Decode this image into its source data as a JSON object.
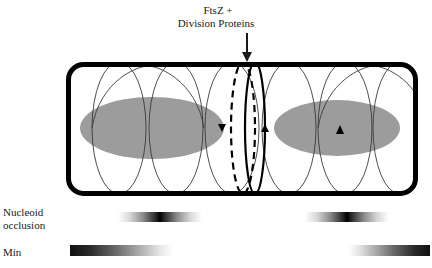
{
  "figure": {
    "title_label": {
      "line1": "FtsZ +",
      "line2": "Division Proteins"
    },
    "nucleoid_occlusion_label": {
      "line1": "Nucleoid",
      "line2": "occlusion"
    },
    "min_label": "Min",
    "colors": {
      "cell_wall": "#000000",
      "nucleoid_fill": "#9c9c9c",
      "helix_stroke": "#3a3a3a",
      "zring_stroke": "#000000",
      "background": "#ffffff",
      "text": "#1a1a1a"
    },
    "cell": {
      "x": 66,
      "y": 62,
      "width": 352,
      "height": 134,
      "corner_radius": 16,
      "wall_thickness": 5
    },
    "nucleoids": [
      {
        "name": "left-nucleoid",
        "cx": 152,
        "cy": 128,
        "rx": 72,
        "ry": 31
      },
      {
        "name": "right-nucleoid",
        "cx": 337,
        "cy": 128,
        "rx": 63,
        "ry": 28
      }
    ],
    "helix_rings": [
      {
        "cx": 119,
        "ry_ratio": 1.0
      },
      {
        "cx": 176,
        "ry_ratio": 1.0
      },
      {
        "cx": 232,
        "ry_ratio": 1.0
      },
      {
        "cx": 289,
        "ry_ratio": 1.0
      },
      {
        "cx": 345,
        "ry_ratio": 1.0
      },
      {
        "cx": 400,
        "ry_ratio": 1.0
      }
    ],
    "zring": {
      "dashed_cx": 243,
      "solid_cx": 253,
      "label": "Z-ring"
    },
    "arrow": {
      "x": 247,
      "y_start": 33,
      "y_end": 60
    },
    "arrowheads": [
      {
        "name": "left-ring-arrowhead",
        "x": 222,
        "y": 128,
        "direction": "down"
      },
      {
        "name": "right-ring-arrowhead",
        "x": 265,
        "y": 128,
        "direction": "up"
      },
      {
        "name": "nucleoid-ring-arrowhead",
        "x": 340,
        "y": 128,
        "direction": "up"
      }
    ],
    "gradient_bars": [
      {
        "name": "nucleoid-occlusion-left-bar",
        "x": 118,
        "y": 212,
        "width": 84,
        "height": 10,
        "type": "symmetric",
        "peak": "center"
      },
      {
        "name": "nucleoid-occlusion-right-bar",
        "x": 305,
        "y": 212,
        "width": 84,
        "height": 10,
        "type": "symmetric",
        "peak": "center"
      },
      {
        "name": "min-left-bar",
        "x": 70,
        "y": 245,
        "width": 103,
        "height": 11,
        "type": "linear",
        "peak": "left"
      },
      {
        "name": "min-right-bar",
        "x": 348,
        "y": 245,
        "width": 82,
        "height": 11,
        "type": "linear",
        "peak": "right"
      }
    ]
  }
}
